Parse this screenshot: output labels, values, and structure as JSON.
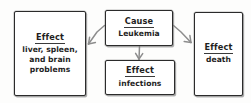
{
  "diagram": {
    "type": "cause-and-effect-map",
    "nodes": [
      {
        "id": "effect-organs",
        "head": "Effect",
        "body": "liver, spleen,\nand brain\nproblems"
      },
      {
        "id": "cause",
        "head": "Cause",
        "body": "Leukemia"
      },
      {
        "id": "effect-infections",
        "head": "Effect",
        "body": "infections"
      },
      {
        "id": "effect-death",
        "head": "Effect",
        "body": "death"
      }
    ],
    "edges": [
      {
        "id": "cause-to-organs",
        "from": "cause",
        "to": "effect-organs",
        "direction": "down-left"
      },
      {
        "id": "cause-to-infections",
        "from": "cause",
        "to": "effect-infections",
        "direction": "down"
      },
      {
        "id": "cause-to-death",
        "from": "cause",
        "to": "effect-death",
        "direction": "down-right"
      }
    ],
    "colors": {
      "background": "#fdfdfc",
      "box_border": "#2b2b2b",
      "box_fill": "#ffffff",
      "text": "#1e1e1e",
      "arrow": "#8d8d8d"
    }
  }
}
